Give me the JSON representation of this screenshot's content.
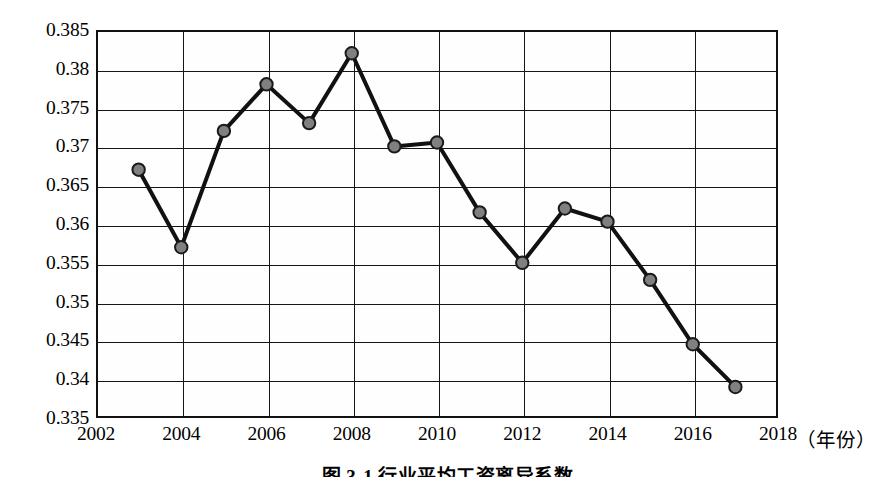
{
  "chart_data": {
    "type": "line",
    "title": "图 3-1  行业平均工资离异系数",
    "xlabel": "（年份）",
    "ylabel": "",
    "x": [
      2003,
      2004,
      2005,
      2006,
      2007,
      2008,
      2009,
      2010,
      2011,
      2012,
      2013,
      2014,
      2015,
      2016,
      2017
    ],
    "values": [
      0.367,
      0.357,
      0.372,
      0.378,
      0.373,
      0.382,
      0.37,
      0.3705,
      0.3615,
      0.355,
      0.362,
      0.3603,
      0.3528,
      0.3445,
      0.339
    ],
    "series": [
      {
        "name": "行业平均工资离异系数",
        "values": [
          0.367,
          0.357,
          0.372,
          0.378,
          0.373,
          0.382,
          0.37,
          0.3705,
          0.3615,
          0.355,
          0.362,
          0.3603,
          0.3528,
          0.3445,
          0.339
        ]
      }
    ],
    "xlim": [
      2002,
      2018
    ],
    "ylim": [
      0.335,
      0.385
    ],
    "xticks": [
      2002,
      2004,
      2006,
      2008,
      2010,
      2012,
      2014,
      2016,
      2018
    ],
    "xtick_labels": [
      "2002",
      "2004",
      "2006",
      "2008",
      "2010",
      "2012",
      "2014",
      "2016",
      "2018"
    ],
    "yticks": [
      0.335,
      0.34,
      0.345,
      0.35,
      0.355,
      0.36,
      0.365,
      0.37,
      0.375,
      0.38,
      0.385
    ],
    "ytick_labels": [
      "0.335",
      "0.34",
      "0.345",
      "0.35",
      "0.355",
      "0.36",
      "0.365",
      "0.37",
      "0.375",
      "0.38",
      "0.385"
    ],
    "grid": true,
    "grid_axes": "both",
    "legend": false,
    "legend_position": "none",
    "marker": "circle",
    "marker_fill_color": "#808080",
    "marker_edge_color": "#1a1a1a",
    "line_color": "#111111",
    "line_width": 4,
    "background_color": "#ffffff",
    "frame_color": "#111111"
  },
  "caption": {
    "text": "图 3-1  行业平均工资离异系数"
  },
  "axis": {
    "x_unit_label": "（年份）"
  }
}
